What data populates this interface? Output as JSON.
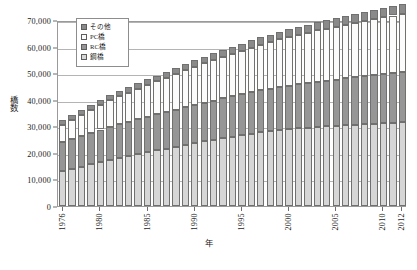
{
  "chart_data": {
    "type": "bar",
    "stacked": true,
    "title": "",
    "xlabel": "年",
    "ylabel": "橋数",
    "ylim": [
      0,
      70000
    ],
    "ytick_values": [
      0,
      10000,
      20000,
      30000,
      40000,
      50000,
      60000,
      70000
    ],
    "ytick_labels": [
      "0",
      "10,000",
      "20,000",
      "30,000",
      "40,000",
      "50,000",
      "60,000",
      "70,000"
    ],
    "grid": true,
    "legend_position": "top-left-inside",
    "categories": [
      "1976",
      "1977",
      "1978",
      "1979",
      "1980",
      "1981",
      "1982",
      "1983",
      "1984",
      "1985",
      "1986",
      "1987",
      "1988",
      "1989",
      "1990",
      "1991",
      "1992",
      "1993",
      "1994",
      "1995",
      "1996",
      "1997",
      "1998",
      "1999",
      "2000",
      "2001",
      "2002",
      "2003",
      "2004",
      "2005",
      "2006",
      "2007",
      "2008",
      "2009",
      "2010",
      "2011",
      "2012"
    ],
    "xtick_labels": [
      "1976",
      "1980",
      "1985",
      "1990",
      "1995",
      "2000",
      "2005",
      "2010",
      "2012"
    ],
    "xtick_category_index": [
      0,
      4,
      9,
      14,
      19,
      24,
      29,
      34,
      36
    ],
    "series": [
      {
        "name": "鋼橋",
        "color": "#d6d6d6",
        "values": [
          13000,
          13900,
          14800,
          15700,
          16600,
          17400,
          18100,
          18800,
          19500,
          20200,
          20900,
          21600,
          22300,
          23000,
          23700,
          24300,
          24900,
          25500,
          26100,
          26700,
          27200,
          27700,
          28100,
          28500,
          28900,
          29200,
          29500,
          29800,
          30000,
          30200,
          30400,
          30600,
          30800,
          31000,
          31200,
          31400,
          31600
        ]
      },
      {
        "name": "RC橋",
        "color": "#969696",
        "values": [
          11000,
          11300,
          11600,
          11900,
          12200,
          12500,
          12800,
          13000,
          13200,
          13400,
          13600,
          13800,
          14000,
          14200,
          14400,
          14600,
          14800,
          15000,
          15200,
          15400,
          15600,
          15800,
          16000,
          16200,
          16400,
          16600,
          16800,
          17000,
          17200,
          17400,
          17600,
          17800,
          18000,
          18200,
          18400,
          18600,
          18800
        ]
      },
      {
        "name": "PC橋",
        "color": "#fbfbfb",
        "values": [
          6600,
          7200,
          7900,
          8600,
          9300,
          9900,
          10400,
          10900,
          11400,
          11900,
          12400,
          12900,
          13400,
          13900,
          14400,
          14800,
          15200,
          15600,
          16000,
          16400,
          16800,
          17200,
          17600,
          18000,
          18400,
          18700,
          19000,
          19300,
          19600,
          19900,
          20200,
          20500,
          20800,
          21100,
          21400,
          21700,
          22000
        ]
      },
      {
        "name": "その他",
        "color": "#8a8a8a",
        "values": [
          1700,
          1750,
          1800,
          1850,
          1900,
          1950,
          2000,
          2050,
          2100,
          2150,
          2200,
          2250,
          2300,
          2350,
          2400,
          2450,
          2500,
          2550,
          2600,
          2650,
          2700,
          2750,
          2800,
          2850,
          2900,
          2950,
          3000,
          3050,
          3100,
          3150,
          3200,
          3250,
          3300,
          3350,
          3400,
          3450,
          3500
        ]
      }
    ],
    "totals": [
      32300,
      34150,
      36100,
      38050,
      40000,
      41750,
      43300,
      44750,
      46200,
      47650,
      49100,
      50550,
      52000,
      53450,
      54900,
      56150,
      57400,
      58650,
      59900,
      61150,
      62300,
      63450,
      64500,
      65550,
      66600,
      67450,
      68300,
      69150,
      69900,
      70650,
      71400,
      72150,
      72900,
      73650,
      74400,
      75150,
      75900
    ]
  },
  "legend": {
    "items": [
      {
        "label": "その他"
      },
      {
        "label": "PC橋"
      },
      {
        "label": "RC橋"
      },
      {
        "label": "鋼橋"
      }
    ]
  }
}
